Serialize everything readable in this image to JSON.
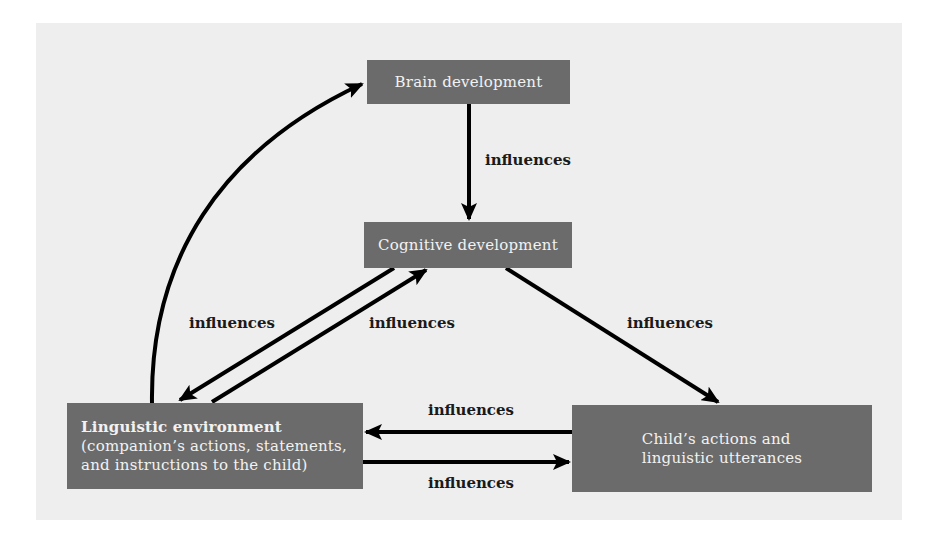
{
  "diagram": {
    "nodes": {
      "brain": {
        "label": "Brain development"
      },
      "cognitive": {
        "label": "Cognitive development"
      },
      "linguistic": {
        "title": "Linguistic environment",
        "line2": "(companion’s actions, statements,",
        "line3": "and instructions to the child)"
      },
      "child": {
        "line1": "Child’s actions and",
        "line2": "linguistic utterances"
      }
    },
    "edges": [
      {
        "from": "Linguistic environment",
        "to": "Brain development",
        "label": ""
      },
      {
        "from": "Brain development",
        "to": "Cognitive development",
        "label": "influences"
      },
      {
        "from": "Cognitive development",
        "to": "Linguistic environment",
        "label": "influences"
      },
      {
        "from": "Linguistic environment",
        "to": "Cognitive development",
        "label": "influences"
      },
      {
        "from": "Cognitive development",
        "to": "Child's actions and linguistic utterances",
        "label": "influences"
      },
      {
        "from": "Child's actions and linguistic utterances",
        "to": "Linguistic environment",
        "label": "influences"
      },
      {
        "from": "Linguistic environment",
        "to": "Child's actions and linguistic utterances",
        "label": "influences"
      }
    ],
    "labels": {
      "brain_to_cog": "influences",
      "cog_to_ling": "influences",
      "ling_to_cog": "influences",
      "cog_to_child": "influences",
      "child_to_ling": "influences",
      "ling_to_child": "influences"
    },
    "colors": {
      "panel": "#eeeeee",
      "box": "#6b6b6b",
      "box_text": "#f2f2f2",
      "arrow": "#000000"
    }
  }
}
